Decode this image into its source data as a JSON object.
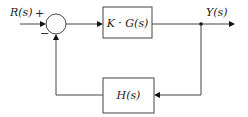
{
  "diagram": {
    "type": "feedback-control-block-diagram",
    "input_label": "R(s)",
    "output_label": "Y(s)",
    "summing_junction": {
      "plus_sign": "+",
      "minus_sign": "−"
    },
    "forward_block": {
      "label": "K · G(s)"
    },
    "feedback_block": {
      "label": "H(s)"
    },
    "colors": {
      "line": "#444444",
      "arrow": "#111111",
      "background": "#ffffff"
    }
  }
}
